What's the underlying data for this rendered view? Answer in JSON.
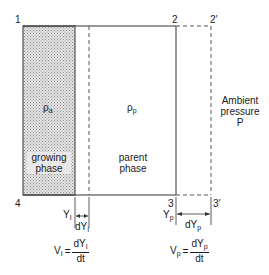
{
  "diagram": {
    "corners": {
      "c1": "1",
      "c2": "2",
      "c2p": "2′",
      "c3": "3",
      "c3p": "3′",
      "c4": "4"
    },
    "growing_phase": {
      "density_symbol": "ρ",
      "density_sub": "a",
      "label_line1": "growing",
      "label_line2": "phase",
      "fill_color": "#cfcfcf"
    },
    "parent_phase": {
      "density_symbol": "ρ",
      "density_sub": "p",
      "label_line1": "parent",
      "label_line2": "phase"
    },
    "ambient": {
      "line1": "Ambient",
      "line2": "pressure",
      "line3": "P"
    },
    "interface_left": {
      "pos_symbol": "Y",
      "pos_sub": "I",
      "delta_symbol": "dY",
      "delta_sub": "I",
      "velocity": {
        "lhs": "V",
        "lhs_sub": "I",
        "equals": "=",
        "num": "dY",
        "num_sub": "I",
        "den": "dt"
      }
    },
    "interface_right": {
      "pos_symbol": "Y",
      "pos_sub": "p",
      "delta_symbol": "dY",
      "delta_sub": "p",
      "velocity": {
        "lhs": "V",
        "lhs_sub": "p",
        "equals": "=",
        "num": "dY",
        "num_sub": "p",
        "den": "dt"
      }
    },
    "line_color": "#333333"
  }
}
